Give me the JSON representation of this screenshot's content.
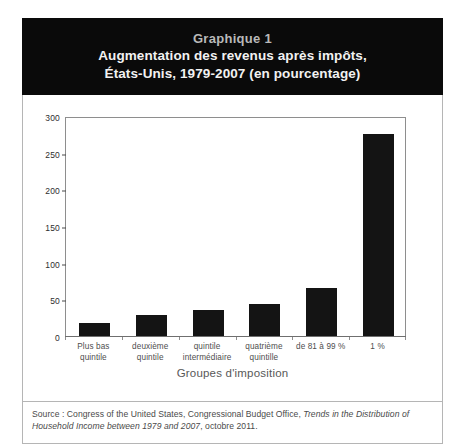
{
  "banner": {
    "figure_label": "Graphique 1",
    "title_line1": "Augmentation des revenus après impôts,",
    "title_line2": "États-Unis, 1979-2007 (en pourcentage)"
  },
  "source": {
    "prefix": "Source : Congress of the United States, Congressional Budget Office, ",
    "italic": "Trends in the Distribution of Household Income between 1979 and 2007",
    "suffix": ", octobre 2011."
  },
  "colors": {
    "banner_background": "#0a0a0a",
    "figure_label": "#b9b9b9",
    "title_text": "#f2f2f2",
    "bar_fill": "#141414",
    "frame": "#8e8e8e",
    "card_border": "#b5b5b5",
    "axis_text": "#4e4e4e"
  },
  "chart_data": {
    "type": "bar",
    "title": "Augmentation des revenus après impôts, États-Unis, 1979-2007 (en pourcentage)",
    "xlabel": "Groupes d'imposition",
    "ylabel": "",
    "ylim": [
      0,
      300
    ],
    "yticks": [
      0,
      50,
      100,
      150,
      200,
      250,
      300
    ],
    "ytick_labels": [
      "0",
      "50",
      "100",
      "150",
      "200",
      "250",
      "300"
    ],
    "grid": false,
    "legend": "none",
    "categories": [
      "Plus bas quintile",
      "deuxième quintile",
      "quintile intermédiaire",
      "quatrième quintile",
      "de 81 à 99 %",
      "1 %"
    ],
    "category_lines": [
      [
        "Plus bas",
        "quintile"
      ],
      [
        "deuxième",
        "quintile"
      ],
      [
        "quintile",
        "intermédiaire"
      ],
      [
        "quatrième",
        "quintille"
      ],
      [
        "de 81 à 99 %"
      ],
      [
        "1 %"
      ]
    ],
    "values": [
      18,
      28,
      35,
      43,
      65,
      275
    ]
  }
}
